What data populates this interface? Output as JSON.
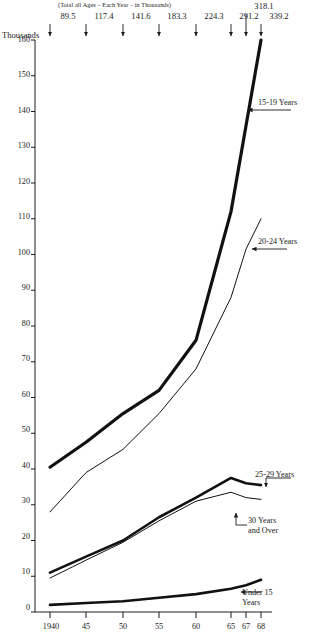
{
  "chart_data": {
    "type": "line",
    "title": "",
    "subtitle": "(Total all Ages – Each Year – in Thousands)",
    "ylabel": "Thousands",
    "xlabel": "",
    "x": [
      1940,
      1945,
      1950,
      1955,
      1960,
      1965,
      1967,
      1968
    ],
    "xtick_labels": [
      "1940",
      "45",
      "50",
      "55",
      "60",
      "65",
      "67",
      "68"
    ],
    "ytick_labels": [
      "0",
      "10",
      "20",
      "30",
      "40",
      "50",
      "60",
      "70",
      "80",
      "90",
      "100",
      "110",
      "120",
      "130",
      "140",
      "150",
      "160"
    ],
    "ylim": [
      0,
      160
    ],
    "ytick_step": 10,
    "grid": false,
    "legend_position": "inline-right-annotations",
    "totals_label": "(Total all Ages – Each Year – in Thousands)",
    "totals": [
      {
        "x": 1940,
        "value": "89.5",
        "raised": false
      },
      {
        "x": 1945,
        "value": "117.4",
        "raised": false
      },
      {
        "x": 1950,
        "value": "141.6",
        "raised": false
      },
      {
        "x": 1955,
        "value": "183.3",
        "raised": false
      },
      {
        "x": 1960,
        "value": "224.3",
        "raised": false
      },
      {
        "x": 1965,
        "value": "291.2",
        "raised": false
      },
      {
        "x": 1967,
        "value": "318.1",
        "raised": true
      },
      {
        "x": 1968,
        "value": "339.2",
        "raised": false
      }
    ],
    "series": [
      {
        "name": "15-19 Years",
        "label_lines": [
          "15-19 Years"
        ],
        "line_width": 3.2,
        "values": [
          40.5,
          47.5,
          55.5,
          62.0,
          76.0,
          112.0,
          136.0,
          160.0
        ]
      },
      {
        "name": "20-24 Years",
        "label_lines": [
          "20-24 Years"
        ],
        "line_width": 1.0,
        "values": [
          28.0,
          39.0,
          45.5,
          55.5,
          68.0,
          88.0,
          101.5,
          110.0
        ]
      },
      {
        "name": "25-29 Years",
        "label_lines": [
          "25-29 Years"
        ],
        "line_width": 2.6,
        "values": [
          11.0,
          15.5,
          20.0,
          26.5,
          32.0,
          37.5,
          36.0,
          35.5
        ]
      },
      {
        "name": "30 Years and Over",
        "label_lines": [
          "30 Years",
          "and Over"
        ],
        "line_width": 1.0,
        "values": [
          9.5,
          14.5,
          19.5,
          25.5,
          31.0,
          33.5,
          32.0,
          31.5
        ]
      },
      {
        "name": "Under 15 Years",
        "label_lines": [
          "Under 15",
          "Years"
        ],
        "line_width": 2.6,
        "values": [
          2.0,
          2.5,
          3.0,
          4.0,
          5.0,
          6.5,
          7.5,
          9.0
        ]
      }
    ]
  }
}
